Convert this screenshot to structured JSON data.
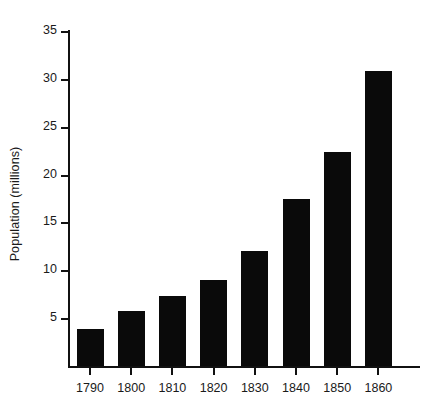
{
  "chart_data": {
    "type": "bar",
    "title": "",
    "subtitle": "",
    "xlabel": "",
    "ylabel": "Population (millions)",
    "categories": [
      "1790",
      "1800",
      "1810",
      "1820",
      "1830",
      "1840",
      "1850",
      "1860"
    ],
    "values": [
      3.9,
      5.7,
      7.3,
      9.0,
      12.0,
      17.4,
      22.4,
      30.8
    ],
    "series": [
      {
        "name": "Population",
        "values": [
          3.9,
          5.7,
          7.3,
          9.0,
          12.0,
          17.4,
          22.4,
          30.8
        ],
        "color": "#0a0a0a"
      }
    ],
    "ylim": [
      0,
      35
    ],
    "yticks": [
      0,
      5,
      10,
      15,
      20,
      25,
      30,
      35
    ],
    "ytick_labels": [
      "",
      "5",
      "10",
      "15",
      "20",
      "25",
      "30",
      "35"
    ],
    "xtick_labels": [
      "1790",
      "1800",
      "1810",
      "1820",
      "1830",
      "1840",
      "1850",
      "1860"
    ],
    "grid": false,
    "legend": false,
    "legend_position": "none",
    "bar_color": "#0a0a0a",
    "background_color": "#ffffff",
    "axis_color": "#111111"
  }
}
